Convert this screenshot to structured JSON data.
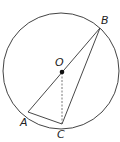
{
  "diagram": {
    "type": "circle-geometry",
    "circle": {
      "center": "O",
      "cx": 61,
      "cy": 71,
      "r": 58
    },
    "points": {
      "O": {
        "label": "O",
        "x": 61,
        "y": 72
      },
      "A": {
        "label": "A",
        "x": 28,
        "y": 112
      },
      "B": {
        "label": "B",
        "x": 100,
        "y": 28
      },
      "C": {
        "label": "C",
        "x": 62,
        "y": 124
      }
    },
    "segments": [
      {
        "from": "A",
        "to": "B",
        "style": "solid",
        "note": "diameter through O"
      },
      {
        "from": "B",
        "to": "C",
        "style": "solid"
      },
      {
        "from": "A",
        "to": "C",
        "style": "solid"
      },
      {
        "from": "O",
        "to": "C",
        "style": "dashed"
      }
    ],
    "colors": {
      "stroke": "#333333",
      "background": "#ffffff"
    }
  }
}
